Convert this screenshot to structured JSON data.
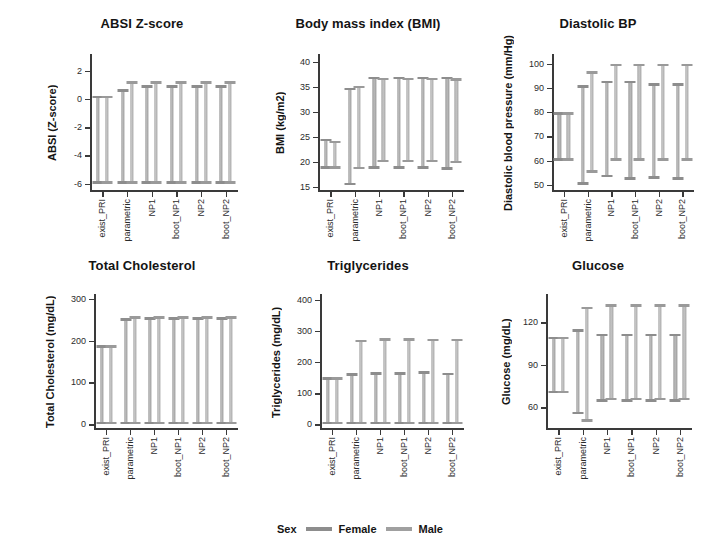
{
  "legend": {
    "title": "Sex",
    "items": [
      {
        "label": "Female",
        "key": "female",
        "color": "#8d8d8d"
      },
      {
        "label": "Male",
        "key": "male",
        "color": "#a0a0a0"
      }
    ]
  },
  "categories": [
    "exist_PRI",
    "parametric",
    "NP1",
    "boot_NP1",
    "NP2",
    "boot_NP2"
  ],
  "chart_data": [
    {
      "type": "bar",
      "id": "absi",
      "title": "ABSI Z-score",
      "xlabel": "",
      "ylabel": "ABSI (Z-score)",
      "ylim": [
        -6.6,
        3.2
      ],
      "yticks": [
        2,
        0,
        -2,
        -4,
        -6
      ],
      "ytick_labels": [
        "2",
        "0",
        "-2",
        "-4",
        "-6"
      ],
      "grid": false,
      "legend_position": "bottom",
      "categories": [
        "exist_PRI",
        "parametric",
        "NP1",
        "boot_NP1",
        "NP2",
        "boot_NP2"
      ],
      "series": [
        {
          "name": "Female",
          "low": [
            -6.0,
            -6.0,
            -6.0,
            -6.0,
            -6.0,
            -6.0
          ],
          "high": [
            0.25,
            0.7,
            1.0,
            1.0,
            1.0,
            1.0
          ]
        },
        {
          "name": "Male",
          "low": [
            -6.0,
            -6.0,
            -6.0,
            -6.0,
            -6.0,
            -6.0
          ],
          "high": [
            0.25,
            1.25,
            1.25,
            1.25,
            1.25,
            1.25
          ]
        }
      ]
    },
    {
      "type": "bar",
      "id": "bmi",
      "title": "Body mass index (BMI)",
      "xlabel": "",
      "ylabel": "BMI (kg/m2)",
      "ylim": [
        14.0,
        41.5
      ],
      "yticks": [
        40,
        35,
        30,
        25,
        20,
        15
      ],
      "ytick_labels": [
        "40",
        "35",
        "30",
        "25",
        "20",
        "15"
      ],
      "grid": false,
      "legend_position": "bottom",
      "categories": [
        "exist_PRI",
        "parametric",
        "NP1",
        "boot_NP1",
        "NP2",
        "boot_NP2"
      ],
      "series": [
        {
          "name": "Female",
          "low": [
            18.6,
            15.3,
            18.6,
            18.6,
            18.6,
            18.4
          ],
          "high": [
            24.6,
            34.8,
            37.0,
            37.0,
            37.0,
            37.0
          ]
        },
        {
          "name": "Male",
          "low": [
            18.6,
            18.5,
            19.9,
            19.9,
            19.9,
            19.7
          ],
          "high": [
            24.2,
            35.2,
            36.8,
            36.8,
            36.8,
            36.7
          ]
        }
      ]
    },
    {
      "type": "bar",
      "id": "dbp",
      "title": "Diastolic BP",
      "xlabel": "",
      "ylabel": "Diastolic blood pressure (mm/Hg)",
      "ylim": [
        47.0,
        104.0
      ],
      "yticks": [
        100,
        90,
        80,
        70,
        60,
        50
      ],
      "ytick_labels": [
        "100",
        "90",
        "80",
        "70",
        "60",
        "50"
      ],
      "grid": false,
      "legend_position": "bottom",
      "categories": [
        "exist_PRI",
        "parametric",
        "NP1",
        "boot_NP1",
        "NP2",
        "boot_NP2"
      ],
      "series": [
        {
          "name": "Female",
          "low": [
            60.0,
            50.0,
            53.0,
            52.0,
            52.5,
            52.0
          ],
          "high": [
            80.0,
            91.0,
            93.0,
            93.0,
            92.0,
            92.0
          ]
        },
        {
          "name": "Male",
          "low": [
            60.0,
            55.0,
            60.0,
            60.0,
            60.0,
            60.0
          ],
          "high": [
            80.0,
            97.0,
            100.0,
            100.0,
            100.0,
            100.0
          ]
        }
      ]
    },
    {
      "type": "bar",
      "id": "chol",
      "title": "Total Cholesterol",
      "xlabel": "",
      "ylabel": "Total Cholesterol (mg/dL)",
      "ylim": [
        -14.0,
        312.0
      ],
      "yticks": [
        300,
        200,
        100,
        0
      ],
      "ytick_labels": [
        "300",
        "200",
        "100",
        "0"
      ],
      "grid": false,
      "legend_position": "bottom",
      "categories": [
        "exist_PRI",
        "parametric",
        "NP1",
        "boot_NP1",
        "NP2",
        "boot_NP2"
      ],
      "series": [
        {
          "name": "Female",
          "low": [
            0.0,
            0.0,
            0.0,
            0.0,
            0.0,
            0.0
          ],
          "high": [
            189.0,
            254.0,
            256.0,
            256.0,
            256.0,
            256.0
          ]
        },
        {
          "name": "Male",
          "low": [
            0.0,
            0.0,
            0.0,
            0.0,
            0.0,
            0.0
          ],
          "high": [
            189.0,
            259.0,
            259.0,
            259.0,
            259.0,
            259.0
          ]
        }
      ]
    },
    {
      "type": "bar",
      "id": "trig",
      "title": "Triglycerides",
      "xlabel": "",
      "ylabel": "Triglycerides (mg/dL)",
      "ylim": [
        -18.0,
        418.0
      ],
      "yticks": [
        400,
        300,
        200,
        100,
        0
      ],
      "ytick_labels": [
        "400",
        "300",
        "200",
        "100",
        "0"
      ],
      "grid": false,
      "legend_position": "bottom",
      "categories": [
        "exist_PRI",
        "parametric",
        "NP1",
        "boot_NP1",
        "NP2",
        "boot_NP2"
      ],
      "series": [
        {
          "name": "Female",
          "low": [
            0.0,
            0.0,
            0.0,
            0.0,
            0.0,
            0.0
          ],
          "high": [
            151.0,
            165.0,
            168.0,
            168.0,
            170.0,
            166.0
          ]
        },
        {
          "name": "Male",
          "low": [
            0.0,
            0.0,
            0.0,
            0.0,
            0.0,
            0.0
          ],
          "high": [
            151.0,
            272.0,
            276.0,
            276.0,
            275.0,
            275.0
          ]
        }
      ]
    },
    {
      "type": "bar",
      "id": "glucose",
      "title": "Glucose",
      "xlabel": "",
      "ylabel": "Glucose (mg/dL)",
      "ylim": [
        44.0,
        140.0
      ],
      "yticks": [
        120,
        90,
        60
      ],
      "ytick_labels": [
        "120",
        "90",
        "60"
      ],
      "grid": false,
      "legend_position": "bottom",
      "categories": [
        "exist_PRI",
        "parametric",
        "NP1",
        "boot_NP1",
        "NP2",
        "boot_NP2"
      ],
      "series": [
        {
          "name": "Female",
          "low": [
            70.0,
            55.0,
            64.0,
            64.0,
            64.0,
            64.0
          ],
          "high": [
            110.0,
            115.0,
            112.0,
            112.0,
            112.0,
            112.0
          ]
        },
        {
          "name": "Male",
          "low": [
            70.0,
            50.0,
            65.0,
            65.0,
            65.0,
            65.0
          ],
          "high": [
            110.0,
            131.0,
            133.0,
            133.0,
            133.0,
            133.0
          ]
        }
      ]
    }
  ]
}
